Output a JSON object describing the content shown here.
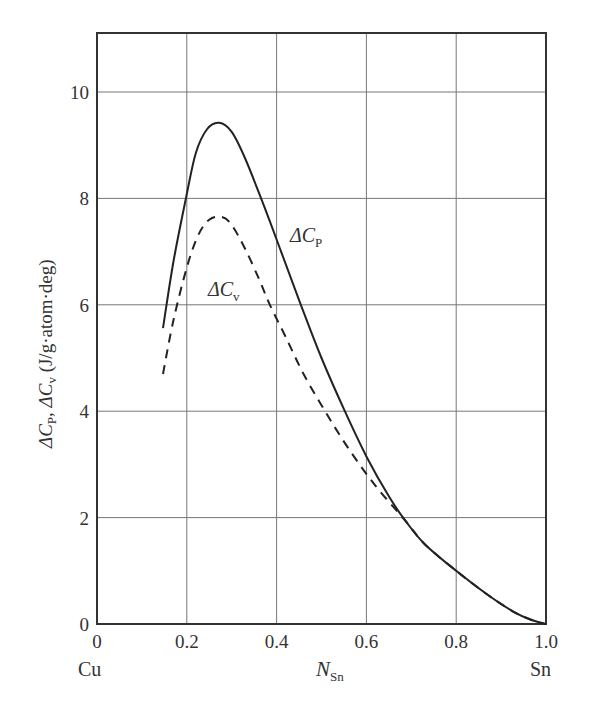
{
  "chart_data": {
    "type": "line",
    "title": "",
    "xlabel": "N_Sn",
    "xlabel_main": "N",
    "xlabel_sub": "Sn",
    "ylabel": "ΔC_P, ΔC_v (J/g·atom·deg)",
    "ylabel_parts": {
      "p1": "ΔC",
      "p1sub": "P",
      "sep": ", ",
      "p2": "ΔC",
      "p2sub": "v",
      "units": " (J/g·atom·deg)"
    },
    "xlim": [
      0,
      1.0
    ],
    "ylim": [
      0,
      11.1
    ],
    "grid": true,
    "x_ticks": [
      "0",
      "0.2",
      "0.4",
      "0.6",
      "0.8",
      "1.0"
    ],
    "x_tick_values": [
      0,
      0.2,
      0.4,
      0.6,
      0.8,
      1.0
    ],
    "y_ticks": [
      "0",
      "2",
      "4",
      "6",
      "8",
      "10"
    ],
    "y_tick_values": [
      0,
      2,
      4,
      6,
      8,
      10
    ],
    "x_end_labels": {
      "left": "Cu",
      "right": "Sn"
    },
    "series": [
      {
        "name": "ΔC_P",
        "label_main": "ΔC",
        "label_sub": "P",
        "style": "solid",
        "x": [
          0.147,
          0.17,
          0.198,
          0.22,
          0.245,
          0.272,
          0.3,
          0.33,
          0.37,
          0.41,
          0.454,
          0.5,
          0.552,
          0.6,
          0.65,
          0.686,
          0.73,
          0.8,
          0.87,
          0.93,
          0.97,
          1.0
        ],
        "y": [
          5.56,
          6.8,
          8.0,
          8.85,
          9.3,
          9.42,
          9.25,
          8.75,
          7.9,
          7.0,
          6.0,
          5.0,
          4.0,
          3.15,
          2.4,
          1.95,
          1.5,
          1.0,
          0.55,
          0.22,
          0.07,
          0.0
        ]
      },
      {
        "name": "ΔC_v",
        "label_main": "ΔC",
        "label_sub": "v",
        "style": "dashed",
        "x": [
          0.147,
          0.17,
          0.2,
          0.225,
          0.25,
          0.278,
          0.3,
          0.33,
          0.36,
          0.385,
          0.42,
          0.46,
          0.508,
          0.56,
          0.62,
          0.686,
          0.73,
          0.8,
          0.87,
          0.93,
          0.97,
          1.0
        ],
        "y": [
          4.7,
          5.7,
          6.7,
          7.3,
          7.6,
          7.65,
          7.5,
          7.05,
          6.5,
          6.0,
          5.4,
          4.7,
          4.0,
          3.3,
          2.6,
          1.95,
          1.5,
          1.0,
          0.55,
          0.22,
          0.07,
          0.0
        ]
      }
    ],
    "annotations": [
      {
        "text": "ΔC_P",
        "x": 0.43,
        "y": 7.1
      },
      {
        "text": "ΔC_v",
        "x": 0.26,
        "y": 6.5
      }
    ]
  }
}
